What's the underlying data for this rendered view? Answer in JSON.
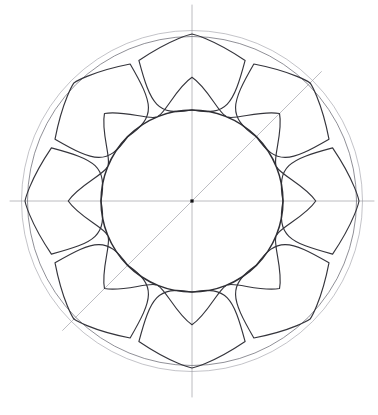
{
  "figure": {
    "medium": "pencil line drawing",
    "background_color": "#ffffff"
  },
  "canvas": {
    "width": 378,
    "height": 415
  },
  "geometry": {
    "center": {
      "x": 192,
      "y": 201,
      "label": "compass center point"
    },
    "center_dot_size": 3.2,
    "circles": [
      {
        "name": "outer-ring-outer",
        "radius": 170.5,
        "stroke": "#9b9ba3",
        "weight": 0.8
      },
      {
        "name": "outer-ring-inner",
        "radius": 164.5,
        "stroke": "#6d6d76",
        "weight": 0.85
      },
      {
        "name": "inner-circle",
        "radius": 91,
        "stroke": "#2f2f35",
        "weight": 1.5
      }
    ],
    "axes": [
      {
        "name": "horizontal-axis",
        "angle_deg": 0,
        "extent": 182
      },
      {
        "name": "vertical-axis",
        "angle_deg": 90,
        "extent": 196
      },
      {
        "name": "diagonal-axis-ne-sw",
        "angle_deg": 45,
        "extent": 183
      }
    ],
    "petals": {
      "count": 8,
      "angles_deg": [
        0,
        45,
        90,
        135,
        180,
        225,
        270,
        315
      ],
      "tip_radius": 167,
      "cusp_radius": 91,
      "lobe_half_angle_deg": 22.5,
      "shape": "heart-lotus petal, outward point at outer ring, inward cusp notch on inner circle"
    }
  },
  "colors": {
    "paper": "#ffffff",
    "construction_gray": "#8e8e96",
    "outer_ring_gray": "#6d6d76",
    "petal_ink": "#35353c",
    "inner_circle_ink": "#2f2f35",
    "center_dot_ink": "#111114"
  }
}
